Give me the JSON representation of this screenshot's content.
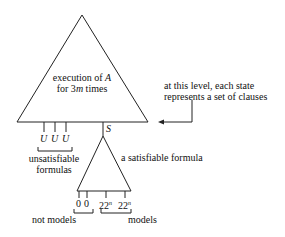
{
  "diagram": {
    "big_triangle": {
      "line1": "execution of ",
      "line1_var": "A",
      "line2_pre": "for 3",
      "line2_var": "m",
      "line2_post": " times"
    },
    "annotation": {
      "line1": "at this level, each state",
      "line2": "represents a set of clauses"
    },
    "unsat": {
      "leaves": [
        "U",
        "U",
        "U"
      ],
      "label_line1": "unsatisfiable",
      "label_line2": "formulas"
    },
    "state_label": "S",
    "small_triangle": {
      "label": "a satisfiable formula"
    },
    "leaves": {
      "zero1": "0",
      "zero2": "0",
      "big1_base": "22",
      "big1_exp": "n",
      "big2_base": "22",
      "big2_exp": "n"
    },
    "not_models_label": "not models",
    "models_label": "models"
  }
}
